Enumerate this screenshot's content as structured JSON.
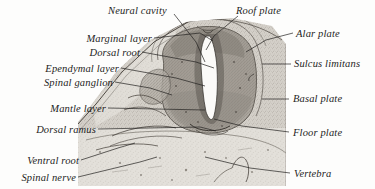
{
  "figure": {
    "kind": "histological-micrograph",
    "background_color": "#fdfdfc",
    "ink_color": "#23211f",
    "tissue_tone_light": "#cfcbc4",
    "tissue_tone_mid": "#a9a49c",
    "tissue_tone_dark": "#807a72",
    "canal_color": "#fbfaf8"
  },
  "labels": {
    "left": [
      {
        "text": "Marginal layer",
        "anchor_x": 152,
        "anchor_y": 39
      },
      {
        "text": "Dorsal root",
        "anchor_x": 140,
        "anchor_y": 53
      },
      {
        "text": "Ependymal layer",
        "anchor_x": 119,
        "anchor_y": 69
      },
      {
        "text": "Spinal ganglion",
        "anchor_x": 113,
        "anchor_y": 83
      },
      {
        "text": "Mantle layer",
        "anchor_x": 106,
        "anchor_y": 109
      },
      {
        "text": "Dorsal ramus",
        "anchor_x": 96,
        "anchor_y": 130
      },
      {
        "text": "Ventral root",
        "anchor_x": 79,
        "anchor_y": 161
      },
      {
        "text": "Spinal nerve",
        "anchor_x": 76,
        "anchor_y": 178
      }
    ],
    "top": [
      {
        "text": "Neural cavity",
        "anchor_x": 110,
        "anchor_y": 12
      },
      {
        "text": "Roof plate",
        "anchor_x": 236,
        "anchor_y": 12
      }
    ],
    "right": [
      {
        "text": "Alar plate",
        "anchor_x": 296,
        "anchor_y": 34
      },
      {
        "text": "Sulcus limitans",
        "anchor_x": 293,
        "anchor_y": 64
      },
      {
        "text": "Basal plate",
        "anchor_x": 292,
        "anchor_y": 99
      },
      {
        "text": "Floor plate",
        "anchor_x": 292,
        "anchor_y": 133
      },
      {
        "text": "Vertebra",
        "anchor_x": 293,
        "anchor_y": 174
      }
    ]
  },
  "leaders": {
    "marginal_layer": "M154,38 L200,33 L213,41",
    "dorsal_root": "M142,52 L196,62 L214,68",
    "ependymal_layer": "M121,68 L176,78 L205,86",
    "spinal_ganglion": "M115,82 L150,88 L172,95",
    "mantle_layer": "M108,108 L205,110",
    "dorsal_ramus": "M98,129 L200,127 L216,131",
    "ventral_root": "M81,160 L118,148 L135,143",
    "spinal_nerve": "M78,177 L140,162 L157,157",
    "neural_cavity": "M174,14 L196,42 L205,62",
    "roof_plate": "M238,16 L214,36 L206,50",
    "alar_plate": "M293,33 L266,40 L246,52",
    "sulcus_limitans": "M291,64 L262,64",
    "basal_plate": "M289,99 L262,99",
    "floor_plate": "M289,132 L242,126 L214,119",
    "vertebra": "M290,173 L250,168 L205,157"
  },
  "icons": {
    "neural_tube": "butterfly-shaped-neural-tube",
    "central_canal": "diamond-central-canal",
    "vertebral_cartilage": "vertebral-cartilage-mass"
  }
}
